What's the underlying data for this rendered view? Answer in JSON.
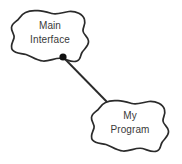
{
  "diagram": {
    "type": "component-collaboration-diagram",
    "background_color": "#ffffff",
    "stroke_color": "#2b2b2b",
    "text_color": "#3a3a3a",
    "nodes": [
      {
        "id": "main-interface",
        "shape": "blob",
        "label_line1": "Main",
        "label_line2": "Interface",
        "x": 10,
        "y": 10,
        "width": 82,
        "height": 53
      },
      {
        "id": "my-program",
        "shape": "blob",
        "label_line1": "My",
        "label_line2": "Program",
        "x": 90,
        "y": 100,
        "width": 82,
        "height": 53
      }
    ],
    "connector": {
      "id": "interface-link",
      "from": "main-interface",
      "to": "my-program",
      "x1": 63,
      "y1": 57,
      "x2": 108,
      "y2": 103,
      "endpoint_marker": "filled-dot",
      "marker_radius": 3.6
    }
  }
}
